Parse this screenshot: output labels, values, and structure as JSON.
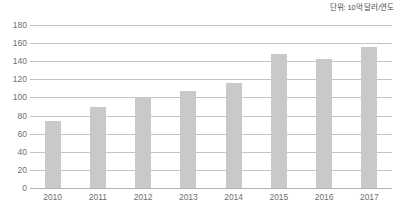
{
  "unit_note": "단위: 10억 달러/연도",
  "chart_data": {
    "type": "bar",
    "title": "",
    "subtitle": "",
    "xlabel": "",
    "ylabel": "",
    "unit_note": "단위: 10억 달러/연도",
    "categories": [
      "2010",
      "2011",
      "2012",
      "2013",
      "2014",
      "2015",
      "2016",
      "2017"
    ],
    "values": [
      74,
      89,
      100,
      107,
      116,
      148,
      143,
      156
    ],
    "series": [
      {
        "name": "",
        "values": [
          74,
          89,
          100,
          107,
          116,
          148,
          143,
          156
        ]
      }
    ],
    "ylim": [
      0,
      180
    ],
    "ytick_step": 20,
    "yticks": [
      180,
      160,
      140,
      120,
      100,
      80,
      60,
      40,
      20,
      0
    ],
    "ytick_labels": [
      "180",
      "160",
      "140",
      "120",
      "100",
      "80",
      "60",
      "40",
      "20",
      "0"
    ],
    "xticks": [
      "2010",
      "2011",
      "2012",
      "2013",
      "2014",
      "2015",
      "2016",
      "2017"
    ],
    "grid": true,
    "grid_axis": "y",
    "legend": false,
    "legend_position": "none",
    "bar_color": "#c9c9c9",
    "gridline_color": "#c4c4c4",
    "axis_color": "#b0b0b0",
    "background_color": "#ffffff",
    "text_color": "#6f6f6f"
  }
}
